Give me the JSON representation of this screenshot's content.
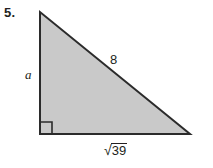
{
  "problem": {
    "number": "5."
  },
  "figure": {
    "type": "right-triangle",
    "fill_color": "#c9c9c9",
    "stroke_color": "#2b2b2b",
    "vertices": {
      "top_left": [
        40,
        12
      ],
      "bottom_left": [
        40,
        134
      ],
      "bottom_right": [
        190,
        134
      ]
    },
    "right_angle_marker": {
      "corner": "bottom-left",
      "size": 12
    },
    "labels": {
      "leg_vertical": "a",
      "hypotenuse": "8",
      "leg_horizontal_radical": "√",
      "leg_horizontal_radicand": "39"
    }
  }
}
